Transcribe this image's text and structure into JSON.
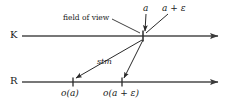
{
  "figure": {
    "type": "diagram",
    "background_color": "#ffffff",
    "line_color": "#3a3a3a",
    "text_color": "#1a1a1a",
    "width": 234,
    "height": 110
  },
  "axes": [
    {
      "id": "k-axis",
      "label": "K",
      "label_x": 10,
      "label_y": 31,
      "line_y": 36,
      "line_x_start": 22,
      "line_x_end": 226,
      "arrow": "right"
    },
    {
      "id": "r-axis",
      "label": "R",
      "label_x": 10,
      "label_y": 77,
      "line_y": 82,
      "line_x_start": 22,
      "line_x_end": 226,
      "arrow": "right"
    }
  ],
  "points": [
    {
      "id": "field-of-view-point",
      "axis": "k-axis",
      "x": 143,
      "y": 36,
      "tick": true
    },
    {
      "id": "o-a-point",
      "axis": "r-axis",
      "x": 73,
      "y": 82,
      "tick": true
    },
    {
      "id": "o-a-eps-point",
      "axis": "r-axis",
      "x": 122,
      "y": 82,
      "tick": true
    }
  ],
  "labels": {
    "a": {
      "text": "a",
      "x": 143,
      "y": 5,
      "style": "math"
    },
    "a_plus_eps": {
      "text": "a + ε",
      "x": 163,
      "y": 5,
      "style": "math"
    },
    "field_of_view": {
      "text": "field of view",
      "x": 70,
      "y": 17,
      "style": "plain"
    },
    "stm": {
      "text": "stm",
      "x": 98,
      "y": 60,
      "style": "stm"
    },
    "o_a": {
      "text": "o(a)",
      "x": 62,
      "y": 90,
      "style": "math"
    },
    "o_a_plus_eps": {
      "text": "o(a + ε)",
      "x": 104,
      "y": 90,
      "style": "math"
    }
  },
  "connectors": [
    {
      "id": "a-pointer",
      "from": [
        146,
        14
      ],
      "to": [
        145,
        32
      ],
      "arrow_at": "to",
      "description": "vertical arrow from label a down to K axis point"
    },
    {
      "id": "a-eps-pointer",
      "from": [
        167,
        14
      ],
      "to": [
        146,
        33
      ],
      "arrow_at": "to",
      "description": "diagonal arrow from label a plus epsilon down-left to K axis point"
    },
    {
      "id": "field-of-view-pointer",
      "from": [
        110,
        20
      ],
      "to": [
        140,
        33
      ],
      "arrow_at": "none",
      "description": "leader line from field of view text to K axis point"
    },
    {
      "id": "stm-to-o-a",
      "from": [
        142,
        39
      ],
      "to": [
        74,
        79
      ],
      "arrow_at": "to",
      "description": "stm mapping arrow from K point to o(a) on R axis"
    },
    {
      "id": "stm-to-o-a-eps",
      "from": [
        143,
        39
      ],
      "to": [
        123,
        79
      ],
      "arrow_at": "to",
      "description": "stm mapping arrow from K point to o(a+eps) on R axis"
    }
  ]
}
